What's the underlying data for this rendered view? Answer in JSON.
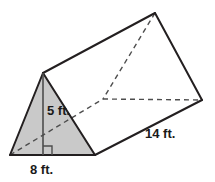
{
  "figure": {
    "name": "triangular-prism",
    "labels": {
      "height": "5 ft.",
      "base": "8 ft.",
      "depth": "14 ft."
    },
    "measurements": {
      "triangle_height_ft": 5,
      "triangle_base_ft": 8,
      "prism_length_ft": 14
    },
    "colors": {
      "face_fill": "#c9c9c9",
      "stroke": "#231f20",
      "hidden_stroke": "#4d4d4d",
      "background": "#ffffff",
      "label_text": "#1a1a1a"
    },
    "geometry": {
      "front_apex": [
        43,
        73
      ],
      "front_bottom_left": [
        10,
        155
      ],
      "front_bottom_right": [
        95,
        155
      ],
      "back_apex": [
        155,
        13
      ],
      "back_bottom_left": [
        103,
        99
      ],
      "back_bottom_right": [
        202,
        100
      ],
      "height_foot": [
        43,
        155
      ]
    },
    "markers": {
      "right_angle": "right-angle-marker"
    }
  }
}
